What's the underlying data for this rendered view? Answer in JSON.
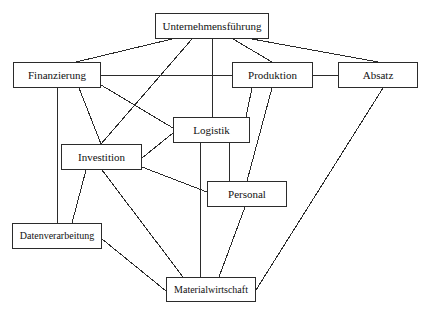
{
  "diagram": {
    "type": "organizational-function-diagram",
    "background_color": "#ffffff",
    "line_color": "#2b2b2b",
    "box_border_color": "#2b2b2b",
    "box_fill_color": "#ffffff",
    "text_color": "#111111",
    "nodes": [
      {
        "id": "unternehmensfuehrung",
        "label": "Unternehmensführung",
        "x": 155,
        "y": 13,
        "w": 114,
        "h": 26,
        "font_size": 11
      },
      {
        "id": "finanzierung",
        "label": "Finanzierung",
        "x": 13,
        "y": 62,
        "w": 88,
        "h": 26,
        "font_size": 11
      },
      {
        "id": "produktion",
        "label": "Produktion",
        "x": 232,
        "y": 62,
        "w": 81,
        "h": 26,
        "font_size": 11
      },
      {
        "id": "absatz",
        "label": "Absatz",
        "x": 338,
        "y": 62,
        "w": 80,
        "h": 26,
        "font_size": 11
      },
      {
        "id": "logistik",
        "label": "Logistik",
        "x": 173,
        "y": 117,
        "w": 77,
        "h": 26,
        "font_size": 11
      },
      {
        "id": "investition",
        "label": "Investition",
        "x": 61,
        "y": 144,
        "w": 81,
        "h": 26,
        "font_size": 11
      },
      {
        "id": "personal",
        "label": "Personal",
        "x": 207,
        "y": 181,
        "w": 80,
        "h": 26,
        "font_size": 11
      },
      {
        "id": "datenverarbeitung",
        "label": "Datenverarbeitung",
        "x": 12,
        "y": 223,
        "w": 90,
        "h": 26,
        "font_size": 10
      },
      {
        "id": "materialwirtschaft",
        "label": "Materialwirtschaft",
        "x": 166,
        "y": 277,
        "w": 90,
        "h": 25,
        "font_size": 10
      }
    ],
    "edges": [
      {
        "from": "unternehmensfuehrung",
        "to": "finanzierung",
        "x1": 172,
        "y1": 39,
        "x2": 76,
        "y2": 62
      },
      {
        "from": "unternehmensfuehrung",
        "to": "investition",
        "x1": 192,
        "y1": 39,
        "x2": 101,
        "y2": 144
      },
      {
        "from": "unternehmensfuehrung",
        "to": "logistik",
        "x1": 212,
        "y1": 39,
        "x2": 212,
        "y2": 117
      },
      {
        "from": "unternehmensfuehrung",
        "to": "produktion",
        "x1": 233,
        "y1": 39,
        "x2": 272,
        "y2": 62
      },
      {
        "from": "unternehmensfuehrung",
        "to": "absatz",
        "x1": 252,
        "y1": 39,
        "x2": 378,
        "y2": 62
      },
      {
        "from": "finanzierung",
        "to": "produktion",
        "x1": 101,
        "y1": 75,
        "x2": 232,
        "y2": 75
      },
      {
        "from": "produktion",
        "to": "absatz",
        "x1": 313,
        "y1": 75,
        "x2": 338,
        "y2": 75
      },
      {
        "from": "finanzierung",
        "to": "logistik",
        "x1": 101,
        "y1": 85,
        "x2": 173,
        "y2": 128
      },
      {
        "from": "finanzierung",
        "to": "investition",
        "x1": 79,
        "y1": 88,
        "x2": 101,
        "y2": 144
      },
      {
        "from": "finanzierung",
        "to": "datenverarbeitung",
        "x1": 57,
        "y1": 88,
        "x2": 57,
        "y2": 223
      },
      {
        "from": "produktion",
        "to": "logistik",
        "x1": 252,
        "y1": 88,
        "x2": 246,
        "y2": 117
      },
      {
        "from": "produktion",
        "to": "personal",
        "x1": 272,
        "y1": 88,
        "x2": 247,
        "y2": 181
      },
      {
        "from": "investition",
        "to": "logistik",
        "x1": 142,
        "y1": 158,
        "x2": 173,
        "y2": 133
      },
      {
        "from": "investition",
        "to": "personal",
        "x1": 142,
        "y1": 167,
        "x2": 207,
        "y2": 192
      },
      {
        "from": "investition",
        "to": "datenverarbeitung",
        "x1": 86,
        "y1": 170,
        "x2": 72,
        "y2": 223
      },
      {
        "from": "investition",
        "to": "materialwirtschaft",
        "x1": 102,
        "y1": 170,
        "x2": 183,
        "y2": 277
      },
      {
        "from": "logistik",
        "to": "materialwirtschaft",
        "x1": 200,
        "y1": 143,
        "x2": 200,
        "y2": 277
      },
      {
        "from": "logistik",
        "to": "personal",
        "x1": 229,
        "y1": 143,
        "x2": 229,
        "y2": 181
      },
      {
        "from": "personal",
        "to": "materialwirtschaft",
        "x1": 245,
        "y1": 207,
        "x2": 219,
        "y2": 277
      },
      {
        "from": "datenverarbeitung",
        "to": "materialwirtschaft",
        "x1": 102,
        "y1": 239,
        "x2": 166,
        "y2": 291
      },
      {
        "from": "absatz",
        "to": "materialwirtschaft",
        "x1": 383,
        "y1": 88,
        "x2": 256,
        "y2": 290
      }
    ]
  }
}
